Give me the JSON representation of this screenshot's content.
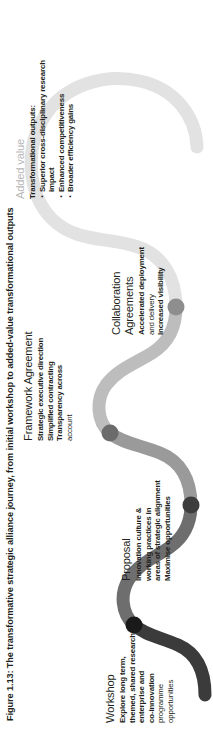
{
  "figure": {
    "caption": "Figure 1.13: The transformative strategic alliance journey, from initial workshop to added-value transformational outputs",
    "colors": {
      "segment_1": "#3b3b3b",
      "segment_2": "#6e6e6e",
      "segment_3": "#9a9a9a",
      "segment_4": "#bdbdbd",
      "segment_5": "#e2e2e2",
      "node_1": "#1a1a1a",
      "node_2": "#3d3d3d",
      "node_3": "#6b6b6b",
      "node_4": "#8e8e8e",
      "text": "#231f20",
      "muted_text": "#b6b6b6",
      "background": "#ffffff"
    }
  },
  "stages": [
    {
      "id": "workshop",
      "title": "Workshop",
      "title_muted": false,
      "lines": [
        "Explore long term,",
        "themed, shared research,",
        "enterprise and",
        "co-innovation"
      ],
      "light_lines": [
        "programme",
        "opportunities"
      ],
      "bullets": []
    },
    {
      "id": "proposal",
      "title": "Proposal",
      "title_muted": false,
      "lines": [
        "Innovation culture &",
        "working practices in",
        "areas of strategic alignment",
        "Maximise opportunities"
      ],
      "light_lines": [],
      "bullets": []
    },
    {
      "id": "framework-agreement",
      "title": "Framework Agreement",
      "title_muted": false,
      "lines": [
        "Strategic executive direction",
        "Simplified contracting",
        "Transparency across"
      ],
      "light_lines": [
        "account"
      ],
      "bullets": []
    },
    {
      "id": "collaboration-agreements",
      "title": "Collaboration\nAgreements",
      "title_muted": false,
      "lines": [
        "Accelerated deployment"
      ],
      "light_lines": [
        "and delivery"
      ],
      "extra_bold_lines": [
        "Increased visibility"
      ],
      "bullets": []
    },
    {
      "id": "added-value",
      "title": "Added value",
      "title_muted": true,
      "lines": [
        "Transformational outputs:"
      ],
      "light_lines": [],
      "bullets": [
        "Superior cross-disciplinary research impact",
        "Enhanced competitiveness",
        "Broader efficiency gains"
      ]
    }
  ]
}
